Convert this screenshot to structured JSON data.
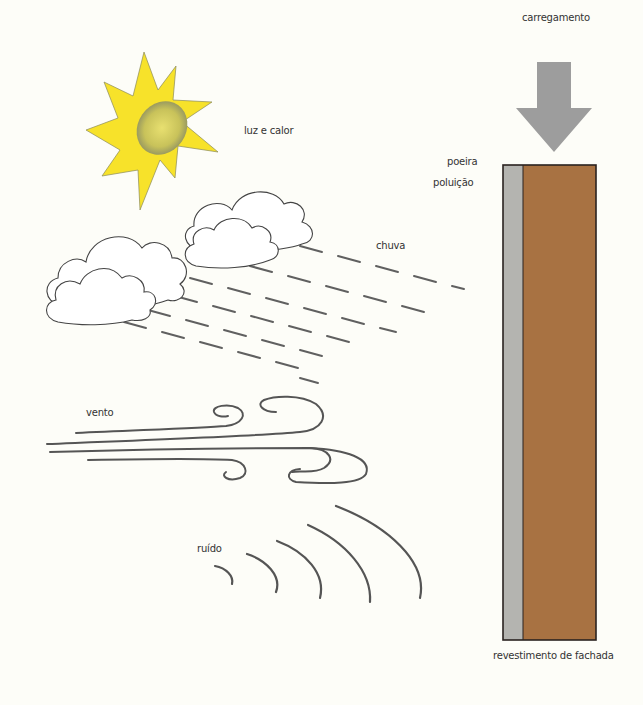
{
  "diagram": {
    "labels": {
      "load": "carregamento",
      "sun": "luz e calor",
      "dust": "poeira",
      "pollution": "poluição",
      "rain": "chuva",
      "wind": "vento",
      "noise": "ruído",
      "facade": "revestimento de fachada"
    },
    "colors": {
      "background": "#fdfdf8",
      "sun_rays": "#f7e22a",
      "sun_core": "#c9c35a",
      "arrow": "#9d9d9d",
      "cladding_layer": "#b4b4b0",
      "wall": "#a87242",
      "outline": "#2a2220",
      "strokes": "#555555"
    },
    "icons": [
      "load-arrow-icon",
      "sun-icon",
      "cloud-icon",
      "rain-icon",
      "wind-icon",
      "noise-waves-icon",
      "facade-wall-section"
    ]
  }
}
